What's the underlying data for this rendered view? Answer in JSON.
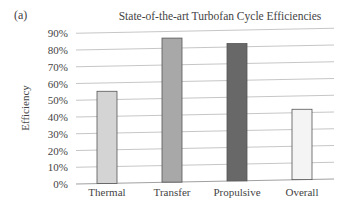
{
  "panel_label": "(a)",
  "chart_data": {
    "type": "bar",
    "title": "State-of-the-art Turbofan Cycle Efficiencies",
    "xlabel": "",
    "ylabel": "Efficiency",
    "categories": [
      "Thermal",
      "Transfer",
      "Propulsive",
      "Overall"
    ],
    "values": [
      55,
      86,
      82,
      42
    ],
    "value_unit": "%",
    "ylim": [
      0,
      90
    ],
    "yticks": [
      "0%",
      "10%",
      "20%",
      "30%",
      "40%",
      "50%",
      "60%",
      "70%",
      "80%",
      "90%"
    ],
    "grid": true,
    "legend": null,
    "bar_colors": [
      "#d4d4d4",
      "#a8a8a8",
      "#686868",
      "#f4f4f4"
    ]
  }
}
